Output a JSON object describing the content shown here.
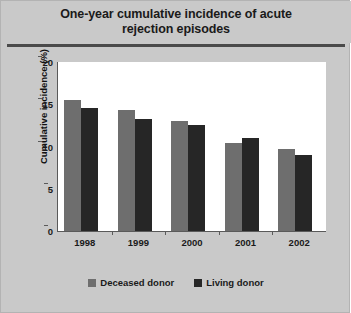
{
  "chart_data": {
    "type": "bar",
    "title": "One-year cumulative incidence of acute rejection episodes",
    "title_line1": "One-year cumulative incidence of acute",
    "title_line2": "rejection episodes",
    "xlabel": "",
    "ylabel": "Cumulative incidence (%)",
    "categories": [
      "1998",
      "1999",
      "2000",
      "2001",
      "2002"
    ],
    "ylim": [
      0,
      20
    ],
    "yticks": [
      "0",
      "5",
      "10",
      "15",
      "20"
    ],
    "ytick_values": [
      0,
      5,
      10,
      15,
      20
    ],
    "grid": false,
    "legend_position": "bottom",
    "series": [
      {
        "name": "Deceased donor",
        "color": "#6e6e6e",
        "values": [
          15.5,
          14.3,
          13.0,
          10.4,
          9.7
        ]
      },
      {
        "name": "Living donor",
        "color": "#262626",
        "values": [
          14.6,
          13.3,
          12.6,
          11.0,
          9.0
        ]
      }
    ]
  },
  "colors": {
    "panel_background": "#c9c9c9",
    "plot_background": "#ffffff",
    "axis": "#5a5a5a",
    "title_rule": "#4a4a4a",
    "deceased_donor": "#6e6e6e",
    "living_donor": "#262626"
  }
}
